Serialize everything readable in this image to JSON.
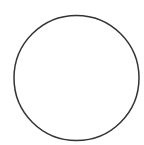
{
  "diagram": {
    "background": "#ffffff",
    "shapes": [
      {
        "type": "circle",
        "cx": 76.5,
        "cy": 78,
        "r": 62.5,
        "stroke": "#333333",
        "stroke_width": 1.5,
        "fill": "none"
      }
    ]
  }
}
